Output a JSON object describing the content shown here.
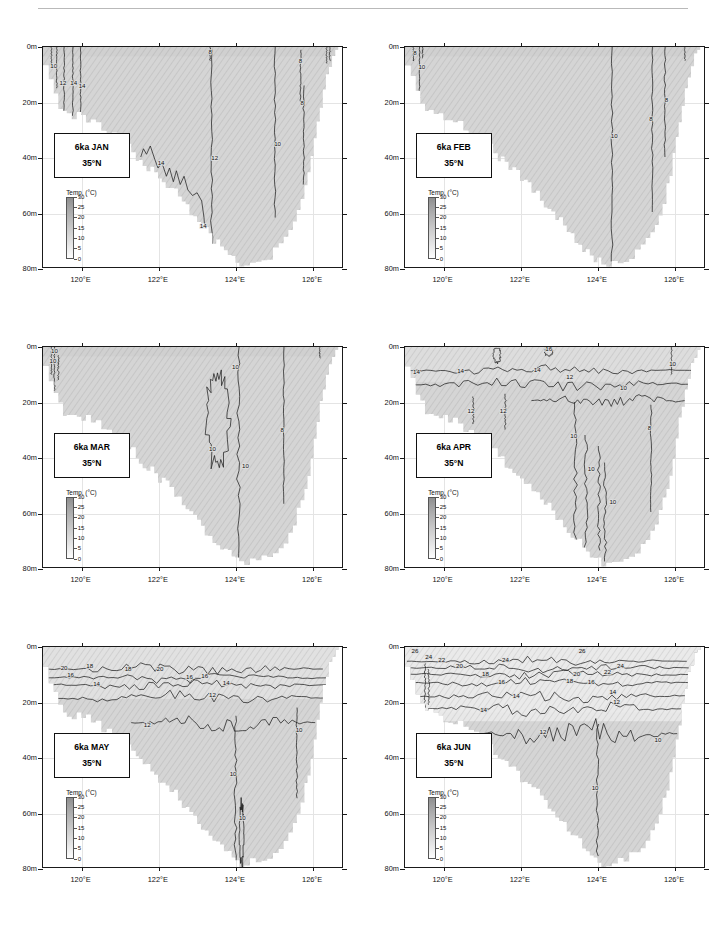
{
  "figure": {
    "axis": {
      "x_ticks": [
        "120°E",
        "122°E",
        "124°E",
        "126°E"
      ],
      "y_ticks": [
        "0m",
        "20m",
        "40m",
        "60m",
        "80m"
      ],
      "xlim": [
        119.0,
        126.8
      ],
      "ylim": [
        0,
        80
      ]
    },
    "colorbar": {
      "title": "Temp. (°C)",
      "ticks": [
        "30",
        "25",
        "20",
        "15",
        "10",
        "5",
        "0"
      ],
      "vmin": 0,
      "vmax": 30
    },
    "latitude_label": "35°N",
    "epoch_label": "6ka"
  },
  "chart_data": {
    "type": "heatmap",
    "xlabel": "Longitude",
    "ylabel": "Depth",
    "x": [
      119.0,
      126.8
    ],
    "ylim": [
      0,
      80
    ],
    "grid": true,
    "legend": "inset colorbar",
    "colorbar_range": [
      0,
      30
    ],
    "colorbar_unit": "°C",
    "panels": [
      {
        "id": "jan",
        "month": "JAN",
        "label": "6ka JAN",
        "sublabel": "35°N",
        "contour_labels": [
          "10",
          "12",
          "14",
          "14",
          "12",
          "8",
          "8",
          "12",
          "10",
          "14",
          "14"
        ],
        "contour_levels": [
          8,
          10,
          12,
          14
        ],
        "surface_temp_range": [
          8,
          14
        ],
        "description": "Weak near-vertical winter contours; 14°C isotherm tracks shelf break diagonally"
      },
      {
        "id": "feb",
        "month": "FEB",
        "label": "6ka FEB",
        "sublabel": "35°N",
        "contour_labels": [
          "8",
          "10",
          "10",
          "6",
          "6"
        ],
        "contour_levels": [
          6,
          8,
          10
        ],
        "surface_temp_range": [
          6,
          10
        ],
        "description": "Coldest month; nearly homogeneous vertical column, 10°C isotherm near 124.4°E"
      },
      {
        "id": "mar",
        "month": "MAR",
        "label": "6ka MAR",
        "sublabel": "35°N",
        "contour_labels": [
          "10",
          "10",
          "10",
          "10",
          "10",
          "8"
        ],
        "contour_levels": [
          8,
          10
        ],
        "surface_temp_range": [
          8,
          10
        ],
        "description": "Closed 10°C cell near 123.5-124°E, vertical 8°C contour near 125.3°E"
      },
      {
        "id": "apr",
        "month": "APR",
        "label": "6ka APR",
        "sublabel": "35°N",
        "contour_labels": [
          "16",
          "14",
          "14",
          "14",
          "12",
          "12",
          "12",
          "10",
          "10",
          "10",
          "10",
          "8"
        ],
        "contour_levels": [
          8,
          10,
          12,
          14,
          16
        ],
        "surface_temp_range": [
          10,
          16
        ],
        "description": "Spring stratification begins; 14°C isotherm near 8m, 12°C near 14m"
      },
      {
        "id": "may",
        "month": "MAY",
        "label": "6ka MAY",
        "sublabel": "35°N",
        "contour_labels": [
          "20",
          "18",
          "16",
          "18",
          "20",
          "20",
          "16",
          "16",
          "14",
          "14",
          "12",
          "12",
          "10",
          "10",
          "10"
        ],
        "contour_levels": [
          10,
          12,
          14,
          16,
          18,
          20
        ],
        "surface_temp_range": [
          14,
          20
        ],
        "description": "Strong thermocline at 10-20m; 20°C surface layer, 12°C isotherm dips to 25m"
      },
      {
        "id": "jun",
        "month": "JUN",
        "label": "6ka JUN",
        "sublabel": "35°N",
        "contour_labels": [
          "26",
          "24",
          "22",
          "20",
          "18",
          "16",
          "14",
          "24",
          "22",
          "20",
          "18",
          "16",
          "14",
          "26",
          "12",
          "12",
          "10",
          "10"
        ],
        "contour_levels": [
          10,
          12,
          14,
          16,
          18,
          20,
          22,
          24,
          26
        ],
        "surface_temp_range": [
          20,
          26
        ],
        "description": "Peak early-summer warming; 26°C surface, sharp thermocline 8-22m, 10°C bottom water"
      }
    ]
  }
}
